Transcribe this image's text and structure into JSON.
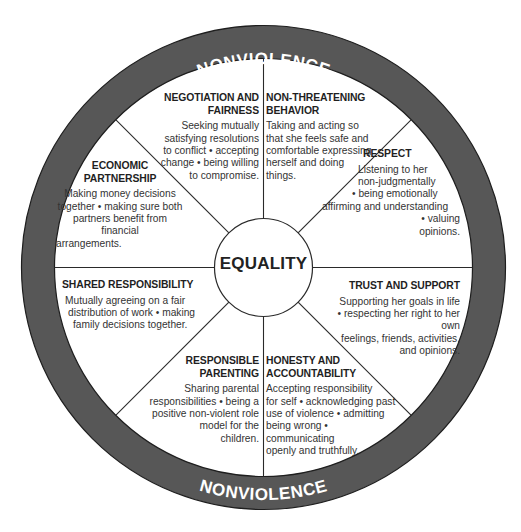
{
  "diagram": {
    "type": "wheel",
    "outer_ring": {
      "top_label": "NONVIOLENCE",
      "bottom_label": "NONVIOLENCE",
      "fill_color": "#575757",
      "text_color": "#ffffff"
    },
    "center": {
      "label": "EQUALITY"
    },
    "segments": [
      {
        "id": "negotiation",
        "title": "NEGOTIATION AND FAIRNESS",
        "title_lines": [
          "NEGOTIATION AND",
          "FAIRNESS"
        ],
        "description": "Seeking mutually satisfying resolutions to conflict • accepting change • being willing to compromise.",
        "desc_lines": [
          "Seeking mutually",
          "satisfying resolutions",
          "to conflict • accepting",
          "change • being willing",
          "to compromise."
        ]
      },
      {
        "id": "non-threatening",
        "title": "NON-THREATENING BEHAVIOR",
        "title_lines": [
          "NON-THREATENING",
          "BEHAVIOR"
        ],
        "description": "Taking and acting so that she feels safe and comfortable expressing herself and doing things.",
        "desc_lines": [
          "Taking and acting so",
          "that she feels safe and",
          "comfortable expressing",
          "herself and doing",
          "things."
        ]
      },
      {
        "id": "respect",
        "title": "RESPECT",
        "title_lines": [
          "RESPECT"
        ],
        "description": "Listening to her non-judgmentally • being emotionally affirming and understanding • valuing opinions.",
        "desc_lines": [
          "Listening to her",
          "non-judgmentally",
          "• being emotionally",
          "affirming and understanding",
          "• valuing",
          "opinions."
        ]
      },
      {
        "id": "trust-support",
        "title": "TRUST AND SUPPORT",
        "title_lines": [
          "TRUST AND SUPPORT"
        ],
        "description": "Supporting her goals in life • respecting her right to her own feelings, friends, activities, and opinions.",
        "desc_lines": [
          "Supporting her goals in life",
          "• respecting her right to her own",
          "feelings, friends, activities,",
          "and opinions."
        ]
      },
      {
        "id": "honesty",
        "title": "HONESTY AND ACCOUNTABILITY",
        "title_lines": [
          "HONESTY AND",
          "ACCOUNTABILITY"
        ],
        "description": "Accepting responsibility for self • acknowledging past use of violence • admitting being wrong • communicating openly and truthfully.",
        "desc_lines": [
          "Accepting responsibility",
          "for self • acknowledging past",
          "use of violence • admitting",
          "being wrong • communicating",
          "openly and truthfully."
        ]
      },
      {
        "id": "parenting",
        "title": "RESPONSIBLE PARENTING",
        "title_lines": [
          "RESPONSIBLE",
          "PARENTING"
        ],
        "description": "Sharing parental responsibilities • being a positive non-violent role model for the children.",
        "desc_lines": [
          "Sharing parental",
          "responsibilities • being a",
          "positive non-violent role",
          "model for the",
          "children."
        ]
      },
      {
        "id": "shared-responsibility",
        "title": "SHARED RESPONSIBILITY",
        "title_lines": [
          "SHARED RESPONSIBILITY"
        ],
        "description": "Mutually agreeing on a fair distribution of work • making family decisions together.",
        "desc_lines": [
          "Mutually agreeing on a fair",
          "distribution of work • making",
          "family decisions together."
        ]
      },
      {
        "id": "economic",
        "title": "ECONOMIC PARTNERSHIP",
        "title_lines": [
          "ECONOMIC",
          "PARTNERSHIP"
        ],
        "description": "Making money decisions together • making sure both partners benefit from financial arrangements.",
        "desc_lines": [
          "Making money decisions",
          "together • making sure both",
          "partners benefit from financial",
          "arrangements."
        ]
      }
    ]
  }
}
